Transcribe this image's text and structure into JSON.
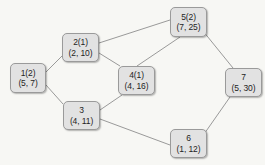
{
  "diagram": {
    "background_color": "#f7f7f4",
    "node_fill_color": "#e2e2e2",
    "node_border_color": "#9a9a9a",
    "edge_color": "#8e8e8e",
    "text_color": "#242424"
  },
  "nodes": [
    {
      "key": "n1",
      "id": "1(2)",
      "pair": "(5, 7)",
      "x": 10,
      "y": 63,
      "w": 36,
      "h": 30
    },
    {
      "key": "n2",
      "id": "2(1)",
      "pair": "(2, 10)",
      "x": 62,
      "y": 33,
      "w": 37,
      "h": 29
    },
    {
      "key": "n3",
      "id": "3",
      "pair": "(4, 11)",
      "x": 63,
      "y": 101,
      "w": 37,
      "h": 29
    },
    {
      "key": "n4",
      "id": "4(1)",
      "pair": "(4, 16)",
      "x": 118,
      "y": 66,
      "w": 37,
      "h": 29
    },
    {
      "key": "n5",
      "id": "5(2)",
      "pair": "(7, 25)",
      "x": 170,
      "y": 7,
      "w": 37,
      "h": 30
    },
    {
      "key": "n6",
      "id": "6",
      "pair": "(1, 12)",
      "x": 170,
      "y": 129,
      "w": 37,
      "h": 29
    },
    {
      "key": "n7",
      "id": "7",
      "pair": "(5, 30)",
      "x": 225,
      "y": 68,
      "w": 37,
      "h": 29
    }
  ],
  "edges": [
    {
      "key": "e1-2",
      "from": "1",
      "to": "2",
      "x1": 46,
      "y1": 72,
      "x2": 62,
      "y2": 56
    },
    {
      "key": "e1-3",
      "from": "1",
      "to": "3",
      "x1": 46,
      "y1": 85,
      "x2": 63,
      "y2": 104
    },
    {
      "key": "e2-5",
      "from": "2",
      "to": "5",
      "x1": 99,
      "y1": 43,
      "x2": 170,
      "y2": 20
    },
    {
      "key": "e2-4",
      "from": "2",
      "to": "4",
      "x1": 99,
      "y1": 53,
      "x2": 120,
      "y2": 66
    },
    {
      "key": "e3-4",
      "from": "3",
      "to": "4",
      "x1": 100,
      "y1": 110,
      "x2": 122,
      "y2": 95
    },
    {
      "key": "e3-6",
      "from": "3",
      "to": "6",
      "x1": 100,
      "y1": 119,
      "x2": 170,
      "y2": 145
    },
    {
      "key": "e4-5",
      "from": "4",
      "to": "5",
      "x1": 137,
      "y1": 66,
      "x2": 180,
      "y2": 37
    },
    {
      "key": "e5-7",
      "from": "5",
      "to": "7",
      "x1": 203,
      "y1": 31,
      "x2": 233,
      "y2": 68
    },
    {
      "key": "e6-7",
      "from": "6",
      "to": "7",
      "x1": 202,
      "y1": 137,
      "x2": 230,
      "y2": 97
    }
  ]
}
